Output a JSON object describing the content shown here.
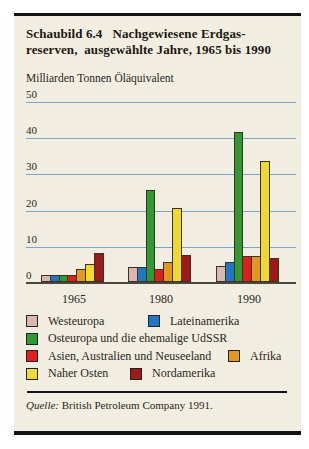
{
  "page": {
    "title_line1": "Schaubild 6.4   Nachgewiesene Erdgas-",
    "title_line2": "reserven,  ausgewählte Jahre, 1965 bis 1990",
    "source_label": "Quelle:",
    "source_text": " British Petroleum Company 1991."
  },
  "chart_data": {
    "type": "bar",
    "ylabel": "Milliarden Tonnen Öläquivalent",
    "xlabel": "",
    "categories": [
      "1965",
      "1980",
      "1990"
    ],
    "series": [
      {
        "name": "Westeuropa",
        "color": "#dcb6b2",
        "values": [
          1.5,
          3.5,
          4
        ]
      },
      {
        "name": "Lateinamerika",
        "color": "#1e78c6",
        "values": [
          1.5,
          3.5,
          5
        ]
      },
      {
        "name": "Osteuropa und die ehemalige UdSSR",
        "color": "#2f9a33",
        "values": [
          1.5,
          25,
          41
        ]
      },
      {
        "name": "Asien, Australien und Neuseeland",
        "color": "#df1f1f",
        "values": [
          1.5,
          3,
          6.5
        ]
      },
      {
        "name": "Afrika",
        "color": "#e2991f",
        "values": [
          3,
          5,
          6.5
        ]
      },
      {
        "name": "Naher Osten",
        "color": "#edd930",
        "values": [
          4.5,
          20,
          33
        ]
      },
      {
        "name": "Nordamerika",
        "color": "#9d1919",
        "values": [
          7.5,
          7,
          6
        ]
      }
    ],
    "ylim": [
      0,
      50
    ],
    "yticks": [
      0,
      10,
      20,
      30,
      40,
      50
    ],
    "grid": true,
    "gridline_color": "#7aa5cb",
    "legend_position": "bottom"
  },
  "legend": {
    "rows": [
      [
        0,
        1
      ],
      [
        2
      ],
      [
        3,
        4
      ],
      [
        5,
        6
      ]
    ]
  }
}
